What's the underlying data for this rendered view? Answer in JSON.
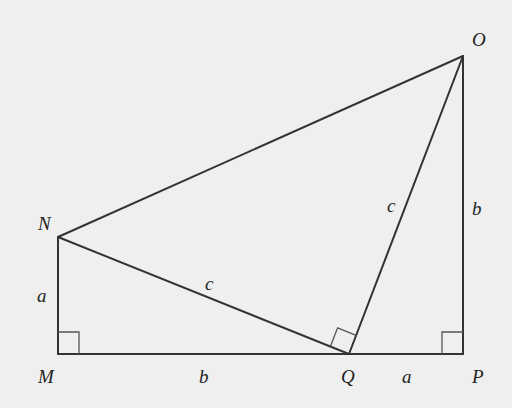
{
  "diagram": {
    "type": "geometry-figure",
    "colors": {
      "background": "#efefef",
      "line": "#333333",
      "label": "#222222"
    },
    "vertices": {
      "O": {
        "label": "O",
        "x": 463,
        "y": 56
      },
      "N": {
        "label": "N",
        "x": 58,
        "y": 237
      },
      "M": {
        "label": "M",
        "x": 58,
        "y": 354
      },
      "Q": {
        "label": "Q",
        "x": 349,
        "y": 354
      },
      "P": {
        "label": "P",
        "x": 463,
        "y": 354
      }
    },
    "segments": [
      {
        "from": "M",
        "to": "N",
        "label": "a"
      },
      {
        "from": "M",
        "to": "Q",
        "label": "b"
      },
      {
        "from": "Q",
        "to": "P",
        "label": "a"
      },
      {
        "from": "P",
        "to": "O",
        "label": "b"
      },
      {
        "from": "N",
        "to": "Q",
        "label": "c"
      },
      {
        "from": "Q",
        "to": "O",
        "label": "c"
      },
      {
        "from": "N",
        "to": "O",
        "label": ""
      }
    ],
    "right_angles": [
      "M",
      "Q",
      "P"
    ],
    "labels": {
      "O": "O",
      "N": "N",
      "M": "M",
      "Q": "Q",
      "P": "P",
      "side_MN": "a",
      "side_MQ": "b",
      "side_QP": "a",
      "side_PO": "b",
      "side_NQ": "c",
      "side_QO": "c"
    }
  }
}
